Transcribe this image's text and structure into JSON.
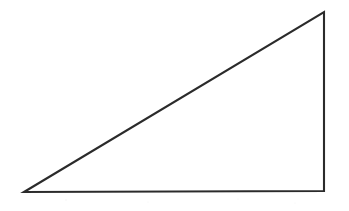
{
  "figure": {
    "name": "right-triangle",
    "canvas": {
      "width": 349,
      "height": 211,
      "background": "#ffffff"
    },
    "stroke": {
      "color": "#2b2b2b",
      "width": 2.1
    },
    "fill": "#ffffff",
    "labels": [],
    "annotations": [],
    "vertices": [
      {
        "name": "bottom-left-vertex",
        "x": 24,
        "y": 192
      },
      {
        "name": "top-right-vertex",
        "x": 324,
        "y": 12
      },
      {
        "name": "bottom-right-vertex",
        "x": 324,
        "y": 191
      }
    ],
    "edges": [
      {
        "name": "hypotenuse",
        "from": "bottom-left-vertex",
        "to": "top-right-vertex"
      },
      {
        "name": "vertical-leg",
        "from": "top-right-vertex",
        "to": "bottom-right-vertex"
      },
      {
        "name": "horizontal-leg",
        "from": "bottom-right-vertex",
        "to": "bottom-left-vertex"
      }
    ],
    "path": "M 24 192 L 324 12 L 324 191 Z"
  },
  "chart_data": {
    "type": "scatter",
    "title": "",
    "xlabel": "",
    "ylabel": "",
    "x": [
      24,
      324,
      324,
      24
    ],
    "y": [
      192,
      12,
      191,
      192
    ],
    "xlim": [
      0,
      349
    ],
    "ylim": [
      0,
      211
    ],
    "grid": false,
    "legend": "none",
    "annotations": [
      "closed polygon: right triangle outline, no tick marks, no labels"
    ]
  }
}
